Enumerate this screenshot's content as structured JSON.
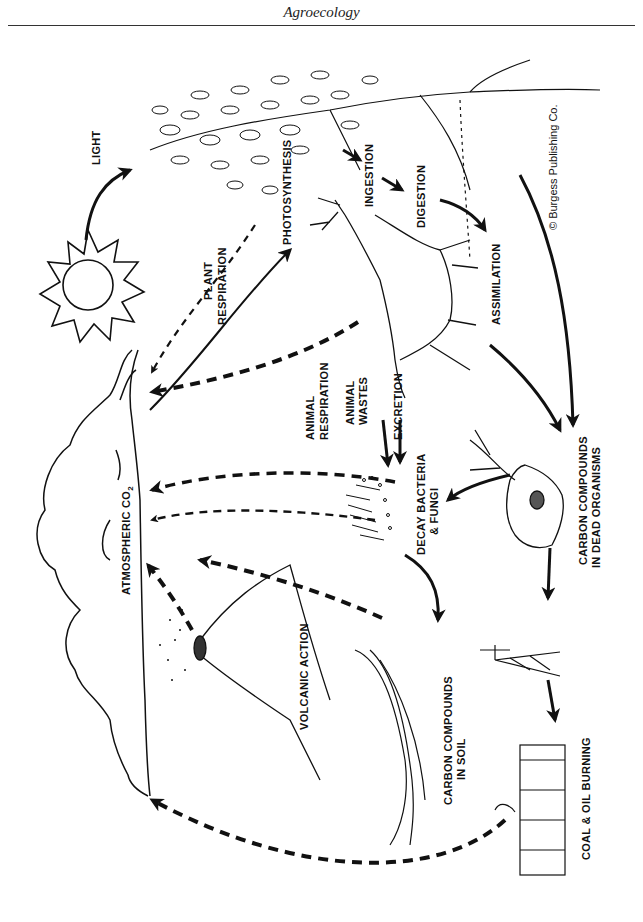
{
  "header": {
    "title": "Agroecology"
  },
  "figure": {
    "type": "carbon-cycle-illustration",
    "orientation": "rotated-90-clockwise",
    "copyright": "© Burgess Publishing Co.",
    "labels": {
      "light": "LIGHT",
      "plant_respiration_1": "PLANT",
      "plant_respiration_2": "RESPIRATION",
      "photosynthesis": "PHOTOSYNTHESIS",
      "ingestion": "INGESTION",
      "digestion": "DIGESTION",
      "assimilation": "ASSIMILATION",
      "animal_respiration_1": "ANIMAL",
      "animal_respiration_2": "RESPIRATION",
      "animal_wastes_1": "ANIMAL",
      "animal_wastes_2": "WASTES",
      "excretion": "EXCRETION",
      "decay_1": "DECAY BACTERIA",
      "decay_2": "& FUNGI",
      "dead_organisms_1": "CARBON COMPOUNDS",
      "dead_organisms_2": "IN DEAD ORGANISMS",
      "atmospheric_co2": "ATMOSPHERIC CO",
      "co2_subscript": "2",
      "volcanic_action": "VOLCANIC ACTION",
      "soil_1": "CARBON COMPOUNDS",
      "soil_2": "IN SOIL",
      "coal_oil": "COAL & OIL BURNING"
    }
  }
}
